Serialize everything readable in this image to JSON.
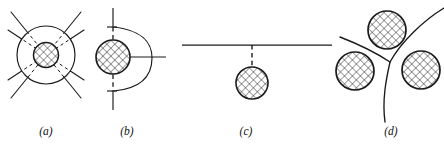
{
  "figure": {
    "width": 444,
    "height": 145,
    "background_color": "#ffffff",
    "ink_color": "#1a1a1a",
    "hatch_color": "#1a1a1a",
    "type": "line-diagram"
  },
  "panels": [
    {
      "id": "a",
      "label": "(a)",
      "label_x": 46,
      "label_y": 135,
      "center_x": 46,
      "center_y": 55,
      "outer_circle_radius": 29,
      "core_circle_radius": 12.5,
      "line_count": 4,
      "line_style_outside": "solid",
      "line_style_inside": "dashed",
      "description": "Four straight lines crossing at a hatched core; lines are dashed where they lie inside the outer circle"
    },
    {
      "id": "b",
      "label": "(b)",
      "label_x": 127,
      "label_y": 135,
      "center_x": 113,
      "center_y": 57,
      "core_circle_radius": 17,
      "vertical_line_x": 113,
      "vertical_line_top": 8,
      "vertical_line_bottom": 110,
      "vertical_style_middle": "dashed",
      "vertical_style_ends": "solid",
      "arc_bulge_x": 152,
      "arc_top_y": 27,
      "arc_bottom_y": 91,
      "tick_length": 7,
      "horizontal_line_y": 57,
      "horizontal_line_end_x": 166,
      "description": "Vertical boundary bowed into a right-bulging arc, pinned at a hatched particle, with a horizontal line leaving the particle to the right"
    },
    {
      "id": "c",
      "label": "(c)",
      "label_x": 246,
      "label_y": 135,
      "center_x": 252,
      "center_y": 83,
      "core_circle_radius": 16,
      "horizontal_line_y": 45,
      "horizontal_line_start_x": 182,
      "horizontal_line_end_x": 332,
      "stem_x": 252,
      "stem_style": "dashed",
      "description": "Straight horizontal boundary with a dashed stem connecting down to a detached hatched particle"
    },
    {
      "id": "d",
      "label": "(d)",
      "label_x": 391,
      "label_y": 135,
      "junction_x": 390,
      "junction_y": 62,
      "core_circle_radius": 19,
      "circles": [
        {
          "cx": 387,
          "cy": 30,
          "r": 19
        },
        {
          "cx": 355,
          "cy": 71,
          "r": 19
        },
        {
          "cx": 421,
          "cy": 70,
          "r": 19
        }
      ],
      "branch_count": 3,
      "description": "Curved triple junction of three boundaries with a hatched particle sitting in each of the three grains"
    }
  ],
  "legend": {
    "hatch_pattern": "cross-hatch",
    "hatch_angle_deg": 45,
    "hatch_spacing": 4
  }
}
